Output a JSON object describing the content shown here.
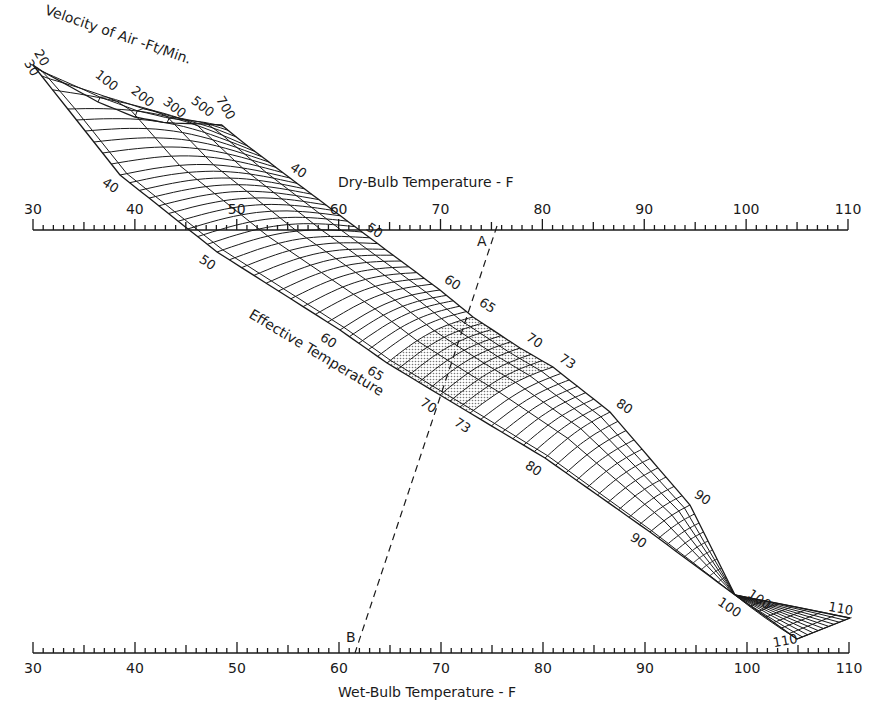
{
  "chart_data": {
    "type": "nomogram",
    "scales": {
      "dry_bulb": {
        "label": "Dry-Bulb Temperature - F",
        "min": 30,
        "max": 110,
        "major_ticks": [
          30,
          40,
          50,
          60,
          70,
          80,
          90,
          100,
          110
        ],
        "minor_step": 1,
        "position": "top"
      },
      "wet_bulb": {
        "label": "Wet-Bulb Temperature - F",
        "min": 30,
        "max": 110,
        "major_ticks": [
          30,
          40,
          50,
          60,
          70,
          80,
          90,
          100,
          110
        ],
        "minor_step": 1,
        "position": "bottom"
      }
    },
    "velocity": {
      "label": "Velocity of Air -Ft/Min.",
      "lines": [
        20,
        30,
        100,
        200,
        300,
        500,
        700
      ]
    },
    "effective_temperature": {
      "label": "Effective Temperature",
      "range": [
        30,
        100
      ],
      "line_step": 1,
      "labels_lower_edge": [
        40,
        50,
        60,
        65,
        70,
        73,
        80,
        90,
        100
      ],
      "labels_upper_edge": [
        40,
        50,
        60,
        65,
        70,
        73,
        80,
        90,
        100
      ],
      "extension_labels": [
        110,
        110
      ],
      "comfort_zone_shaded": [
        65,
        73
      ]
    },
    "example_line": {
      "start_label": "A",
      "start_dry_bulb": 76,
      "end_label": "B",
      "end_wet_bulb": 62,
      "style": "dashed"
    }
  },
  "geometry": {
    "db_axis": {
      "y": 230,
      "x30": 33,
      "x110": 848,
      "tick_minor": 5,
      "tick_mid": 8,
      "tick_major": 11
    },
    "wb_axis": {
      "y": 653,
      "x30": 33,
      "x110": 849,
      "tick_minor": 5,
      "tick_mid": 8,
      "tick_major": 11
    },
    "lower_edge": [
      [
        30,
        33,
        65
      ],
      [
        40,
        120,
        175
      ],
      [
        50,
        217,
        252
      ],
      [
        60,
        340,
        330
      ],
      [
        65,
        387,
        363
      ],
      [
        70,
        440,
        395
      ],
      [
        73,
        470,
        413
      ],
      [
        80,
        545,
        458
      ],
      [
        90,
        650,
        532
      ],
      [
        100,
        735,
        595
      ]
    ],
    "upper_edge": [
      [
        30,
        220,
        125
      ],
      [
        40,
        290,
        178
      ],
      [
        50,
        362,
        232
      ],
      [
        60,
        440,
        290
      ],
      [
        65,
        473,
        317
      ],
      [
        70,
        520,
        348
      ],
      [
        73,
        553,
        367
      ],
      [
        80,
        610,
        412
      ],
      [
        90,
        690,
        505
      ],
      [
        100,
        735,
        595
      ]
    ],
    "top_edge": [
      [
        0,
        33,
        65
      ],
      [
        0.04,
        40,
        70
      ],
      [
        0.35,
        98,
        102
      ],
      [
        0.55,
        135,
        117
      ],
      [
        0.72,
        167,
        123
      ],
      [
        0.86,
        205,
        124
      ],
      [
        1,
        222,
        125
      ]
    ],
    "velocity_s": [
      0,
      0.04,
      0.35,
      0.55,
      0.72,
      0.86,
      1.0
    ],
    "ext_pinch": [
      735,
      595
    ],
    "ext_right": [
      850,
      618
    ],
    "ext_bottom": [
      797,
      639
    ],
    "a_point": [
      497,
      226
    ],
    "b_point": [
      355,
      653
    ]
  },
  "text": {
    "db_title": "Dry-Bulb Temperature - F",
    "wb_title": "Wet-Bulb Temperature - F",
    "velocity_title": "Velocity of Air -Ft/Min.",
    "et_title": "Effective Temperature",
    "a_label": "A",
    "b_label": "B"
  },
  "colors": {
    "ink": "#1a1a1a",
    "shade": "#c8c8c8",
    "paper": "#ffffff"
  }
}
